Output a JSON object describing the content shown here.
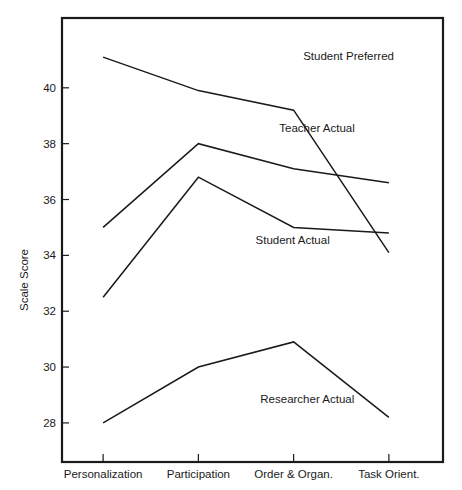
{
  "chart_data": {
    "type": "line",
    "title": "",
    "xlabel": "",
    "ylabel": "Scale Score",
    "categories": [
      "Personalization",
      "Participation",
      "Order & Organ.",
      "Task Orient."
    ],
    "ylim": [
      26.6,
      42.5
    ],
    "yticks": [
      28,
      30,
      32,
      34,
      36,
      38,
      40
    ],
    "ytick_labels": [
      "28",
      "30",
      "32",
      "34",
      "36",
      "38",
      "40"
    ],
    "grid": false,
    "legend_position": "inline-labels",
    "series": [
      {
        "name": "Student Preferred",
        "values": [
          41.1,
          39.9,
          39.2,
          34.1
        ],
        "label_x": 2.1,
        "label_y": 41.0
      },
      {
        "name": "Teacher Actual",
        "values": [
          35.0,
          38.0,
          37.1,
          36.6
        ],
        "label_x": 1.85,
        "label_y": 38.4
      },
      {
        "name": "Student Actual",
        "values": [
          32.5,
          36.8,
          35.0,
          34.8
        ],
        "label_x": 1.6,
        "label_y": 34.4
      },
      {
        "name": "Researcher Actual",
        "values": [
          28.0,
          30.0,
          30.9,
          28.2
        ],
        "label_x": 1.65,
        "label_y": 28.7
      }
    ]
  },
  "colors": {
    "line": "#1a1a1a",
    "axis": "#1a1a1a",
    "background": "#ffffff"
  }
}
